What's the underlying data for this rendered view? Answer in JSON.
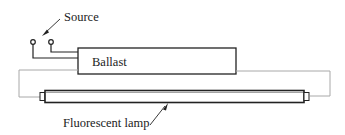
{
  "diagram": {
    "type": "circuit",
    "labels": {
      "source": "Source",
      "ballast": "Ballast",
      "lamp": "Fluorescent lamp"
    },
    "colors": {
      "line": "#222222",
      "wire_gray": "#a8a8a8",
      "background": "#ffffff"
    },
    "components": [
      {
        "id": "source",
        "kind": "terminal-pair"
      },
      {
        "id": "ballast",
        "kind": "box"
      },
      {
        "id": "lamp",
        "kind": "tube"
      }
    ]
  }
}
